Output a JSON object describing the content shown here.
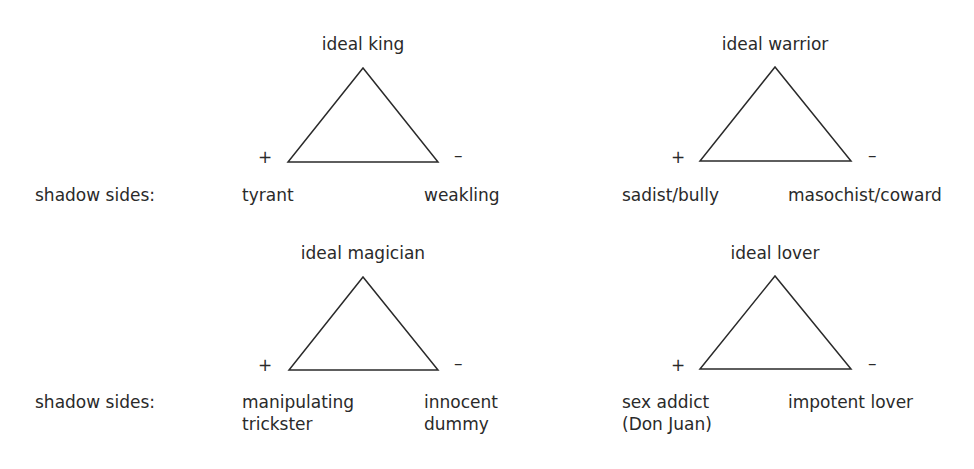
{
  "row_label": "shadow sides:",
  "archetypes": [
    {
      "title": "ideal king",
      "plus": "+",
      "minus": "–",
      "shadow_positive": [
        "tyrant"
      ],
      "shadow_negative": [
        "weakling"
      ]
    },
    {
      "title": "ideal warrior",
      "plus": "+",
      "minus": "–",
      "shadow_positive": [
        "sadist/bully"
      ],
      "shadow_negative": [
        "masochist/coward"
      ]
    },
    {
      "title": "ideal magician",
      "plus": "+",
      "minus": "–",
      "shadow_positive": [
        "manipulating",
        "trickster"
      ],
      "shadow_negative": [
        "innocent",
        "dummy"
      ]
    },
    {
      "title": "ideal lover",
      "plus": "+",
      "minus": "–",
      "shadow_positive": [
        "sex addict",
        "(Don Juan)"
      ],
      "shadow_negative": [
        "impotent lover"
      ]
    }
  ]
}
